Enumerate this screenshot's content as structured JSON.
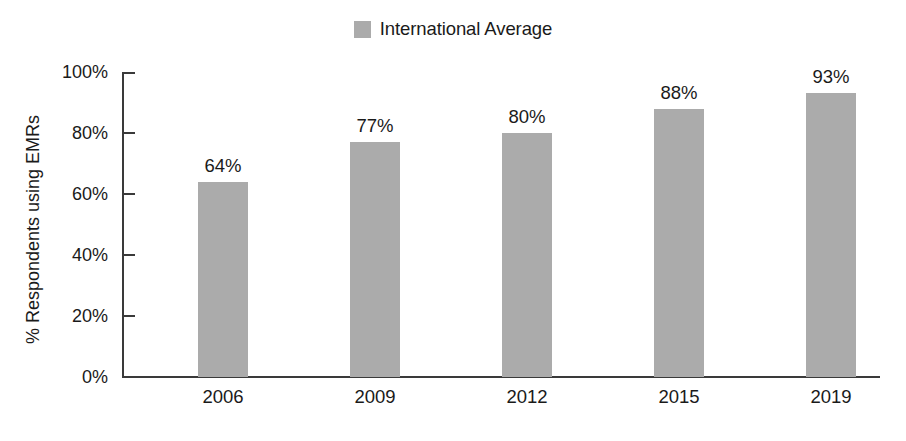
{
  "chart_data": {
    "type": "bar",
    "title": "",
    "subtitle": "",
    "categories": [
      "2006",
      "2009",
      "2012",
      "2015",
      "2019"
    ],
    "values": [
      64,
      77,
      80,
      88,
      93
    ],
    "value_labels": [
      "64%",
      "77%",
      "80%",
      "88%",
      "93%"
    ],
    "series": [
      {
        "name": "International Average",
        "values": [
          64,
          77,
          80,
          88,
          93
        ],
        "color": "#ababab"
      }
    ],
    "xlabel": "",
    "ylabel": "% Respondents using EMRs",
    "ylim": [
      0,
      100
    ],
    "yticks": [
      0,
      20,
      40,
      60,
      80,
      100
    ],
    "ytick_labels": [
      "0%",
      "20%",
      "40%",
      "60%",
      "80%",
      "100%"
    ],
    "grid": false,
    "legend": {
      "position": "top-center",
      "entries": [
        {
          "label": "International Average",
          "color": "#ababab",
          "swatch": "square-swatch"
        }
      ]
    },
    "colors": {
      "bar": "#ababab",
      "axis": "#3a3a3a",
      "text": "#1a1a1a",
      "background": "#ffffff"
    }
  }
}
